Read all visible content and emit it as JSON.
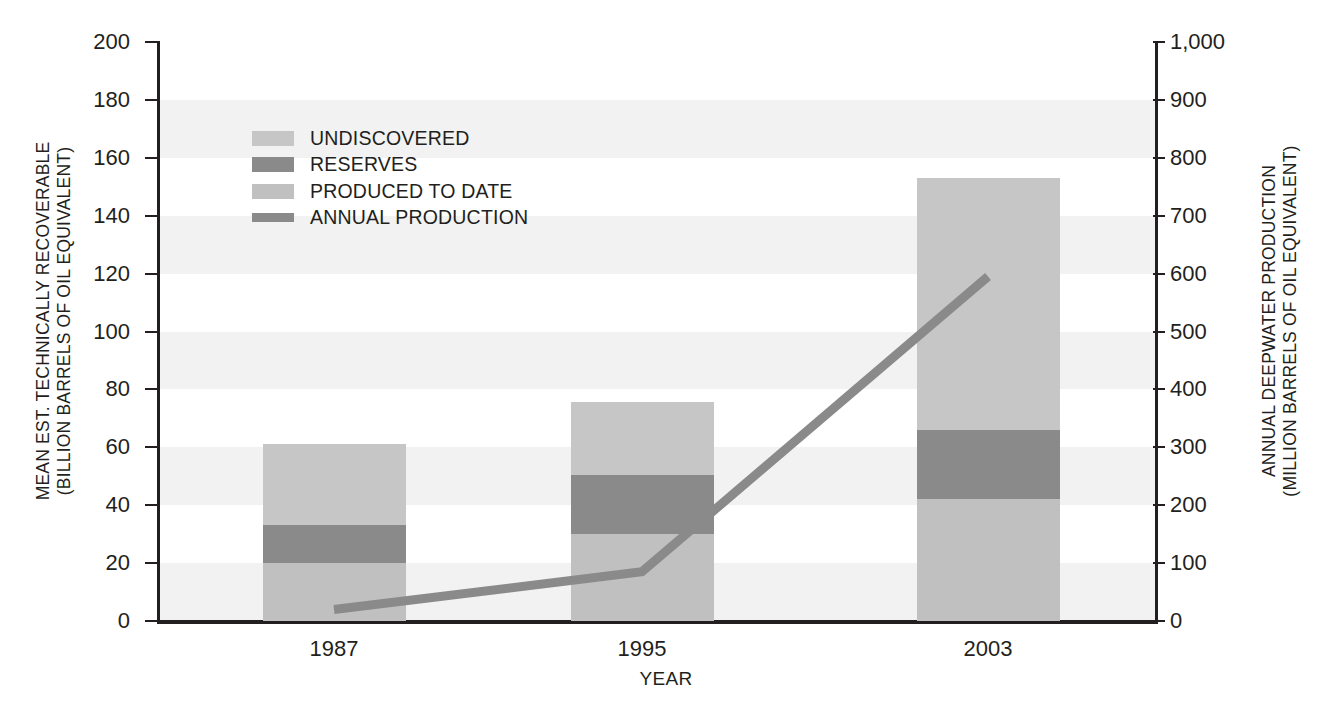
{
  "chart_data": {
    "type": "bar",
    "title": "",
    "subtitle": "",
    "xlabel": "YEAR",
    "ylabel": "MEAN EST. TECHNICALLY RECOVERABLE (BILLION BARRELS OF OIL EQUIVALENT)",
    "ylabel_line1": "MEAN EST. TECHNICALLY RECOVERABLE",
    "ylabel_line2": "(BILLION BARRELS OF OIL EQUIVALENT)",
    "y2label": "ANNUAL DEEPWATER PRODUCTION (MILLION BARRELS OF OIL EQUIVALENT)",
    "y2label_line1": "ANNUAL DEEPWATER PRODUCTION",
    "y2label_line2": "(MILLION BARRELS OF OIL EQUIVALENT)",
    "categories": [
      "1987",
      "1995",
      "2003"
    ],
    "ylim": [
      0,
      200
    ],
    "y2lim": [
      0,
      1000
    ],
    "yticks": [
      0,
      20,
      40,
      60,
      80,
      100,
      120,
      140,
      160,
      180,
      200
    ],
    "ytick_labels": [
      "0",
      "20",
      "40",
      "60",
      "80",
      "100",
      "120",
      "140",
      "160",
      "180",
      "200"
    ],
    "y2ticks": [
      0,
      100,
      200,
      300,
      400,
      500,
      600,
      700,
      800,
      900,
      1000
    ],
    "y2tick_labels": [
      "0",
      "100",
      "200",
      "300",
      "400",
      "500",
      "600",
      "700",
      "800",
      "900",
      "1,000"
    ],
    "grid": "horizontal-bands",
    "legend_position": "upper-left-inside",
    "stacked": true,
    "series": [
      {
        "name": "PRODUCED TO DATE",
        "type": "bar-segment",
        "color": "#c0c0c0",
        "axis": "left",
        "values": [
          20,
          30,
          42
        ]
      },
      {
        "name": "RESERVES",
        "type": "bar-segment",
        "color": "#8a8a8a",
        "axis": "left",
        "values": [
          13,
          20.5,
          24
        ]
      },
      {
        "name": "UNDISCOVERED",
        "type": "bar-segment",
        "color": "#c6c6c6",
        "axis": "left",
        "values": [
          28,
          25,
          87
        ]
      },
      {
        "name": "ANNUAL PRODUCTION",
        "type": "line",
        "color": "#8a8a8a",
        "axis": "right",
        "values": [
          20,
          85,
          595
        ]
      }
    ],
    "bar_totals": [
      61,
      75.5,
      153
    ],
    "annotations": []
  },
  "legend": {
    "items": [
      {
        "label": "UNDISCOVERED",
        "swatch": "legend-swatch-undiscovered",
        "kind": "box",
        "color": "#c6c6c6"
      },
      {
        "label": "RESERVES",
        "swatch": "legend-swatch-reserves",
        "kind": "box",
        "color": "#8a8a8a"
      },
      {
        "label": "PRODUCED TO DATE",
        "swatch": "legend-swatch-produced",
        "kind": "box",
        "color": "#c0c0c0"
      },
      {
        "label": "ANNUAL PRODUCTION",
        "swatch": "legend-swatch-annual",
        "kind": "line",
        "color": "#8a8a8a"
      }
    ]
  },
  "colors": {
    "undiscovered": "#c6c6c6",
    "reserves": "#8a8a8a",
    "produced": "#c0c0c0",
    "line": "#8a8a8a",
    "band": "#f2f2f2",
    "axis": "#231f20",
    "background": "#ffffff"
  }
}
